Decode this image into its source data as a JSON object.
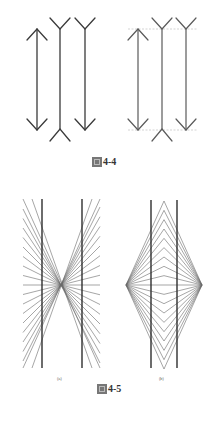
{
  "figures": [
    {
      "id": "fig-4-4",
      "caption_prefix": "圖",
      "caption_number": "4-4",
      "panels": [
        {
          "name": "illusion-plain",
          "arrows": [
            {
              "x": 37,
              "type": "outward"
            },
            {
              "x": 60,
              "type": "inward"
            },
            {
              "x": 85,
              "type": "mixed"
            }
          ]
        },
        {
          "name": "illusion-guides",
          "arrows": [
            {
              "x": 138,
              "type": "outward"
            },
            {
              "x": 162,
              "type": "inward"
            },
            {
              "x": 186,
              "type": "mixed"
            }
          ],
          "guide_lines_y": [
            29,
            130
          ]
        }
      ]
    },
    {
      "id": "fig-4-5",
      "caption_prefix": "圖",
      "caption_number": "4-5",
      "subfigures": [
        {
          "label": "(a)",
          "description": "Hering illusion: parallel lines over radiating rays"
        },
        {
          "label": "(b)",
          "description": "Wundt illusion: parallel lines over converging rays"
        }
      ]
    }
  ],
  "colors": {
    "line_dark": "#3a3a3a",
    "line_mid": "#5a5a5a",
    "ray": "#6a6a6a",
    "guide": "#c8c8c8"
  }
}
